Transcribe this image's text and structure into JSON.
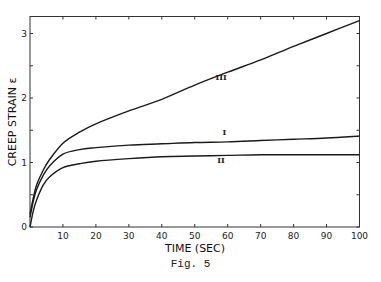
{
  "chart_data": {
    "type": "line",
    "title": "",
    "caption": "Fig. 5",
    "xlabel": "TIME (SEC)",
    "ylabel": "CREEP STRAIN ε",
    "xlim": [
      0,
      100
    ],
    "ylim": [
      0,
      3.25
    ],
    "x_ticks": [
      10,
      20,
      30,
      40,
      50,
      60,
      70,
      80,
      90,
      100
    ],
    "x_tick_labels": [
      "10",
      "20",
      "30",
      "40",
      "50",
      "60",
      "70",
      "80",
      "90",
      "100"
    ],
    "y_ticks": [
      0,
      0.5,
      1,
      1.5,
      2,
      2.5,
      3
    ],
    "y_tick_labels": [
      "0",
      "",
      "1",
      "",
      "2",
      "",
      "3"
    ],
    "origin_label": "0",
    "grid": false,
    "legend": "inline curve labels",
    "x": [
      0,
      1,
      2,
      4,
      6,
      10,
      15,
      20,
      30,
      40,
      50,
      60,
      70,
      80,
      90,
      100
    ],
    "series": [
      {
        "name": "III",
        "label_pos": {
          "x": 58,
          "y": 2.28
        },
        "values": [
          0.2,
          0.45,
          0.65,
          0.88,
          1.05,
          1.3,
          1.47,
          1.6,
          1.8,
          1.98,
          2.2,
          2.4,
          2.59,
          2.8,
          3.0,
          3.2
        ]
      },
      {
        "name": "I",
        "label_pos": {
          "x": 59,
          "y": 1.42
        },
        "values": [
          0.15,
          0.4,
          0.58,
          0.8,
          0.95,
          1.13,
          1.2,
          1.23,
          1.27,
          1.29,
          1.31,
          1.32,
          1.34,
          1.36,
          1.38,
          1.41
        ]
      },
      {
        "name": "II",
        "label_pos": {
          "x": 58,
          "y": 1.0
        },
        "values": [
          0.0,
          0.25,
          0.42,
          0.65,
          0.78,
          0.92,
          0.98,
          1.02,
          1.06,
          1.09,
          1.1,
          1.11,
          1.12,
          1.12,
          1.12,
          1.12
        ]
      }
    ]
  },
  "labels": {
    "xlabel": "TIME (SEC)",
    "ylabel": "CREEP STRAIN ε",
    "caption": "Fig. 5"
  }
}
